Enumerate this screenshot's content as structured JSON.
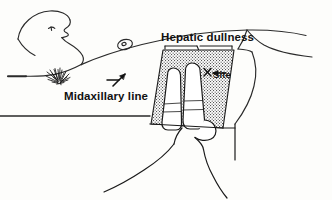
{
  "figure": {
    "background_color": "#fdfdfb",
    "ink_color": "#1a1a1a",
    "hatch_color": "#4a4a4a"
  },
  "labels": {
    "hepatic_dullness": "Hepatic dullness",
    "midaxillary_line": "Midaxillary line",
    "site": "Site"
  },
  "markers": {
    "site_arrow": "left-arrow-icon",
    "site_cross": "x-mark-icon",
    "midaxillary_pointer": "up-right-arrow-icon",
    "hepatic_leader": "bracket-leader-line",
    "axillary_hair": "axillary-hair-tuft",
    "nipple": "nipple-areola-mark"
  },
  "regions": {
    "hepatic_dullness_band": "hatched parallelogram band over lower lateral chest",
    "examiner_hand": "hand with extended middle finger used as pleximeter",
    "patient_head": "head in profile facing upward",
    "patient_arm": "abducted arm along the upper left edge",
    "examination_table": "horizontal table edge line at left"
  }
}
